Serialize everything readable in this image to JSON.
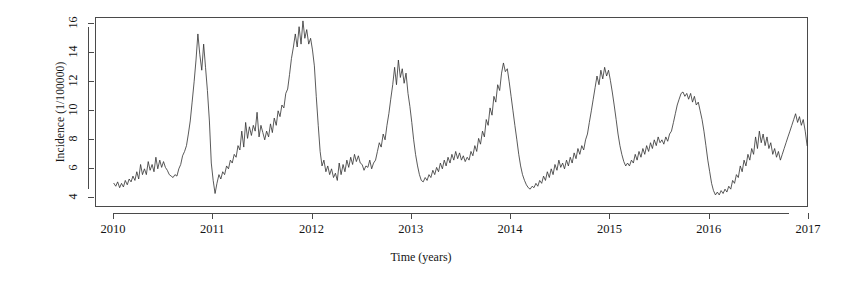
{
  "chart_data": {
    "type": "line",
    "title": "",
    "xlabel": "Time (years)",
    "ylabel": "Incidence (1/100000)",
    "xlim": [
      2009.82,
      2017.0
    ],
    "ylim": [
      3.3,
      16.4
    ],
    "xticks": [
      2010,
      2011,
      2012,
      2013,
      2014,
      2015,
      2016,
      2017
    ],
    "xtick_labels": [
      "2010",
      "2011",
      "2012",
      "2013",
      "2014",
      "2015",
      "2016",
      "2017"
    ],
    "yticks": [
      4,
      6,
      8,
      10,
      12,
      14,
      16
    ],
    "ytick_labels": [
      "4",
      "6",
      "8",
      "10",
      "12",
      "14",
      "16"
    ],
    "grid": false,
    "legend": false,
    "line_color": "#303030",
    "line_width": 0.8,
    "series": [
      {
        "name": "Incidence",
        "x": [
          2010.0,
          2010.019,
          2010.038,
          2010.058,
          2010.077,
          2010.096,
          2010.115,
          2010.135,
          2010.154,
          2010.173,
          2010.192,
          2010.212,
          2010.231,
          2010.25,
          2010.269,
          2010.288,
          2010.308,
          2010.327,
          2010.346,
          2010.365,
          2010.385,
          2010.404,
          2010.423,
          2010.442,
          2010.462,
          2010.481,
          2010.5,
          2010.519,
          2010.538,
          2010.558,
          2010.577,
          2010.596,
          2010.615,
          2010.635,
          2010.654,
          2010.673,
          2010.692,
          2010.712,
          2010.731,
          2010.75,
          2010.769,
          2010.788,
          2010.808,
          2010.827,
          2010.846,
          2010.865,
          2010.885,
          2010.904,
          2010.923,
          2010.942,
          2010.962,
          2010.981,
          2011.0,
          2011.019,
          2011.038,
          2011.058,
          2011.077,
          2011.096,
          2011.115,
          2011.135,
          2011.154,
          2011.173,
          2011.192,
          2011.212,
          2011.231,
          2011.25,
          2011.269,
          2011.288,
          2011.308,
          2011.327,
          2011.346,
          2011.365,
          2011.385,
          2011.404,
          2011.423,
          2011.442,
          2011.462,
          2011.481,
          2011.5,
          2011.519,
          2011.538,
          2011.558,
          2011.577,
          2011.596,
          2011.615,
          2011.635,
          2011.654,
          2011.673,
          2011.692,
          2011.712,
          2011.731,
          2011.75,
          2011.769,
          2011.788,
          2011.808,
          2011.827,
          2011.846,
          2011.865,
          2011.885,
          2011.904,
          2011.923,
          2011.942,
          2011.962,
          2011.981,
          2012.0,
          2012.019,
          2012.038,
          2012.058,
          2012.077,
          2012.096,
          2012.115,
          2012.135,
          2012.154,
          2012.173,
          2012.192,
          2012.212,
          2012.231,
          2012.25,
          2012.269,
          2012.288,
          2012.308,
          2012.327,
          2012.346,
          2012.365,
          2012.385,
          2012.404,
          2012.423,
          2012.442,
          2012.462,
          2012.481,
          2012.5,
          2012.519,
          2012.538,
          2012.558,
          2012.577,
          2012.596,
          2012.615,
          2012.635,
          2012.654,
          2012.673,
          2012.692,
          2012.712,
          2012.731,
          2012.75,
          2012.769,
          2012.788,
          2012.808,
          2012.827,
          2012.846,
          2012.865,
          2012.885,
          2012.904,
          2012.923,
          2012.942,
          2012.962,
          2012.981,
          2013.0,
          2013.019,
          2013.038,
          2013.058,
          2013.077,
          2013.096,
          2013.115,
          2013.135,
          2013.154,
          2013.173,
          2013.192,
          2013.212,
          2013.231,
          2013.25,
          2013.269,
          2013.288,
          2013.308,
          2013.327,
          2013.346,
          2013.365,
          2013.385,
          2013.404,
          2013.423,
          2013.442,
          2013.462,
          2013.481,
          2013.5,
          2013.519,
          2013.538,
          2013.558,
          2013.577,
          2013.596,
          2013.615,
          2013.635,
          2013.654,
          2013.673,
          2013.692,
          2013.712,
          2013.731,
          2013.75,
          2013.769,
          2013.788,
          2013.808,
          2013.827,
          2013.846,
          2013.865,
          2013.885,
          2013.904,
          2013.923,
          2013.942,
          2013.962,
          2013.981,
          2014.0,
          2014.019,
          2014.038,
          2014.058,
          2014.077,
          2014.096,
          2014.115,
          2014.135,
          2014.154,
          2014.173,
          2014.192,
          2014.212,
          2014.231,
          2014.25,
          2014.269,
          2014.288,
          2014.308,
          2014.327,
          2014.346,
          2014.365,
          2014.385,
          2014.404,
          2014.423,
          2014.442,
          2014.462,
          2014.481,
          2014.5,
          2014.519,
          2014.538,
          2014.558,
          2014.577,
          2014.596,
          2014.615,
          2014.635,
          2014.654,
          2014.673,
          2014.692,
          2014.712,
          2014.731,
          2014.75,
          2014.769,
          2014.788,
          2014.808,
          2014.827,
          2014.846,
          2014.865,
          2014.885,
          2014.904,
          2014.923,
          2014.942,
          2014.962,
          2014.981,
          2015.0,
          2015.019,
          2015.038,
          2015.058,
          2015.077,
          2015.096,
          2015.115,
          2015.135,
          2015.154,
          2015.173,
          2015.192,
          2015.212,
          2015.231,
          2015.25,
          2015.269,
          2015.288,
          2015.308,
          2015.327,
          2015.346,
          2015.365,
          2015.385,
          2015.404,
          2015.423,
          2015.442,
          2015.462,
          2015.481,
          2015.5,
          2015.519,
          2015.538,
          2015.558,
          2015.577,
          2015.596,
          2015.615,
          2015.635,
          2015.654,
          2015.673,
          2015.692,
          2015.712,
          2015.731,
          2015.75,
          2015.769,
          2015.788,
          2015.808,
          2015.827,
          2015.846,
          2015.865,
          2015.885,
          2015.904,
          2015.923,
          2015.942,
          2015.962,
          2015.981,
          2016.0,
          2016.019,
          2016.038,
          2016.058,
          2016.077,
          2016.096,
          2016.115,
          2016.135,
          2016.154,
          2016.173,
          2016.192,
          2016.212,
          2016.231,
          2016.25,
          2016.269,
          2016.288,
          2016.308,
          2016.327,
          2016.346,
          2016.365,
          2016.385,
          2016.404,
          2016.423,
          2016.442,
          2016.462,
          2016.481,
          2016.5,
          2016.519,
          2016.538,
          2016.558,
          2016.577,
          2016.596,
          2016.615,
          2016.635,
          2016.654,
          2016.673,
          2016.692,
          2016.712,
          2016.731,
          2016.75,
          2016.769,
          2016.788,
          2016.808,
          2016.827,
          2016.846,
          2016.865,
          2016.885,
          2016.904,
          2016.923,
          2016.942,
          2016.962,
          2016.981
        ],
        "values": [
          5.0,
          4.8,
          5.1,
          4.7,
          5.0,
          4.75,
          5.2,
          4.9,
          5.3,
          5.1,
          5.5,
          5.2,
          5.8,
          5.3,
          6.3,
          5.6,
          6.0,
          5.6,
          6.5,
          5.9,
          6.3,
          5.8,
          6.8,
          6.0,
          6.6,
          6.1,
          6.5,
          6.1,
          5.9,
          5.6,
          5.5,
          5.4,
          5.6,
          5.5,
          6.0,
          6.3,
          6.9,
          7.2,
          7.6,
          8.4,
          9.3,
          10.6,
          12.0,
          13.5,
          15.3,
          13.9,
          12.8,
          14.6,
          13.0,
          11.4,
          9.3,
          6.4,
          5.2,
          4.3,
          5.0,
          5.6,
          5.3,
          5.8,
          5.6,
          6.2,
          6.0,
          6.6,
          6.4,
          7.0,
          6.8,
          7.6,
          7.3,
          8.6,
          7.5,
          9.2,
          8.1,
          8.9,
          8.3,
          9.0,
          8.6,
          9.9,
          8.2,
          9.0,
          8.5,
          8.0,
          8.6,
          8.2,
          9.1,
          8.5,
          9.5,
          9.0,
          10.0,
          9.6,
          10.4,
          10.2,
          11.2,
          11.5,
          12.5,
          13.6,
          14.4,
          15.3,
          14.4,
          15.8,
          14.6,
          16.2,
          15.0,
          15.6,
          14.6,
          15.0,
          14.2,
          13.1,
          11.0,
          9.0,
          7.2,
          6.2,
          6.6,
          5.8,
          6.2,
          5.6,
          6.0,
          5.4,
          5.7,
          5.2,
          6.4,
          5.6,
          6.3,
          5.8,
          6.6,
          6.1,
          6.8,
          6.3,
          7.0,
          6.5,
          6.9,
          6.4,
          6.3,
          5.9,
          6.2,
          6.1,
          6.6,
          6.0,
          6.4,
          6.6,
          7.2,
          7.8,
          7.5,
          8.4,
          8.0,
          9.0,
          9.8,
          10.8,
          11.8,
          13.0,
          11.8,
          13.5,
          12.3,
          12.9,
          11.9,
          12.6,
          11.2,
          10.3,
          9.2,
          8.0,
          7.0,
          6.2,
          5.6,
          5.2,
          5.1,
          5.4,
          5.2,
          5.6,
          5.4,
          5.9,
          5.6,
          6.1,
          5.8,
          6.4,
          6.0,
          6.6,
          6.2,
          6.8,
          6.4,
          7.0,
          6.6,
          7.2,
          6.7,
          7.1,
          6.6,
          6.9,
          6.5,
          6.8,
          6.6,
          7.2,
          6.9,
          7.6,
          7.2,
          8.1,
          7.7,
          8.6,
          8.2,
          9.4,
          9.0,
          10.2,
          9.7,
          11.0,
          10.6,
          11.8,
          11.4,
          12.6,
          13.3,
          12.7,
          12.9,
          12.0,
          11.0,
          10.0,
          9.0,
          8.0,
          7.0,
          6.2,
          5.6,
          5.2,
          4.9,
          4.7,
          4.6,
          4.8,
          4.7,
          5.0,
          4.8,
          5.2,
          5.0,
          5.5,
          5.2,
          5.8,
          5.4,
          6.0,
          5.6,
          6.3,
          5.9,
          6.6,
          6.1,
          6.4,
          6.0,
          6.6,
          6.2,
          6.8,
          6.4,
          7.1,
          6.7,
          7.4,
          7.0,
          7.6,
          7.3,
          8.0,
          8.4,
          9.2,
          10.0,
          10.8,
          11.6,
          12.4,
          11.8,
          12.8,
          12.2,
          13.0,
          12.4,
          12.8,
          12.1,
          11.3,
          10.4,
          9.4,
          8.4,
          7.6,
          7.0,
          6.5,
          6.2,
          6.4,
          6.2,
          6.6,
          6.4,
          7.0,
          6.6,
          7.2,
          6.8,
          7.4,
          7.0,
          7.6,
          7.2,
          7.8,
          7.4,
          8.0,
          7.6,
          8.2,
          7.8,
          8.0,
          7.7,
          8.2,
          7.9,
          8.4,
          8.6,
          9.2,
          9.8,
          10.4,
          10.8,
          11.2,
          11.3,
          11.0,
          11.2,
          10.8,
          11.2,
          10.6,
          11.0,
          10.4,
          10.6,
          10.0,
          9.4,
          8.6,
          7.6,
          6.6,
          5.8,
          5.0,
          4.5,
          4.2,
          4.4,
          4.2,
          4.5,
          4.3,
          4.6,
          4.4,
          4.8,
          4.6,
          5.2,
          5.0,
          5.6,
          5.4,
          6.2,
          5.8,
          6.6,
          6.2,
          7.0,
          6.6,
          7.4,
          7.0,
          8.2,
          7.4,
          8.6,
          7.8,
          8.4,
          7.6,
          8.2,
          7.4,
          7.8,
          7.0,
          7.4,
          6.8,
          7.2,
          6.6,
          7.0,
          7.4,
          7.8,
          8.2,
          8.6,
          9.0,
          9.4,
          9.8,
          9.2,
          9.6,
          9.0,
          9.4,
          8.6,
          7.6
        ],
        "peaks": [
          {
            "season": "2010-11 winter",
            "year_frac": 2010.846,
            "value": 15.3
          },
          {
            "season": "2011-12 winter",
            "year_frac": 2011.904,
            "value": 16.2
          },
          {
            "season": "2012-13 winter",
            "year_frac": 2012.865,
            "value": 13.5
          },
          {
            "season": "2013-14 winter",
            "year_frac": 2013.923,
            "value": 13.3
          },
          {
            "season": "2014-15 winter",
            "year_frac": 2014.942,
            "value": 13.0
          },
          {
            "season": "2015 plateau",
            "year_frac": 2015.731,
            "value": 11.3
          },
          {
            "season": "2016-17 winter",
            "year_frac": 2016.865,
            "value": 9.8
          }
        ],
        "start_value": 5.0,
        "end_value": 3.4,
        "min_value": 4.2,
        "max_value": 16.2
      }
    ]
  }
}
